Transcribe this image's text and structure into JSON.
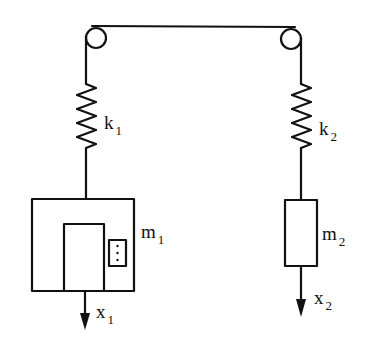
{
  "diagram": {
    "colors": {
      "stroke": "#111111",
      "background": "#ffffff"
    },
    "labels": {
      "k1": {
        "main": "k",
        "sub": "1"
      },
      "k2": {
        "main": "k",
        "sub": "2"
      },
      "m1": {
        "main": "m",
        "sub": "1"
      },
      "m2": {
        "main": "m",
        "sub": "2"
      },
      "x1": {
        "main": "x",
        "sub": "1"
      },
      "x2": {
        "main": "x",
        "sub": "2"
      }
    },
    "components": [
      "pulley-left",
      "pulley-right",
      "rope",
      "spring-k1",
      "spring-k2",
      "mass-m1",
      "mass-m2",
      "arrow-x1",
      "arrow-x2"
    ]
  }
}
